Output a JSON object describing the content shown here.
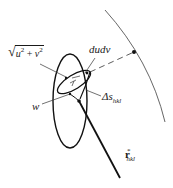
{
  "figure": {
    "labels": {
      "sqrt_radicand_u": "u",
      "sqrt_radicand_plus": " + ",
      "sqrt_radicand_v": "v",
      "sqrt_exponent": "2",
      "area_element": "dudv",
      "w": "w",
      "delta_s_main": "Δs",
      "delta_s_sub": "hkl",
      "r_main": "r",
      "r_sup": "*",
      "r_sub": "hkl"
    },
    "colors": {
      "stroke": "#1a1a1a",
      "arc": "#555555",
      "background": "#ffffff"
    }
  }
}
